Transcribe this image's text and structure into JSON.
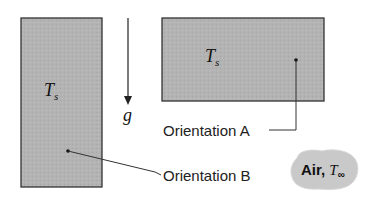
{
  "figure": {
    "orientation_b": {
      "label": "Orientation B",
      "temperature_symbol": "T",
      "temperature_subscript": "s"
    },
    "orientation_a": {
      "label": "Orientation A",
      "temperature_symbol": "T",
      "temperature_subscript": "s"
    },
    "gravity": {
      "symbol": "g"
    },
    "ambient": {
      "label": "Air,",
      "temperature_symbol": "T",
      "temperature_subscript": "∞"
    },
    "colors": {
      "plate_fill": "#b3b3b3",
      "plate_border": "#333333",
      "blob_fill": "#c9c9c9"
    }
  }
}
